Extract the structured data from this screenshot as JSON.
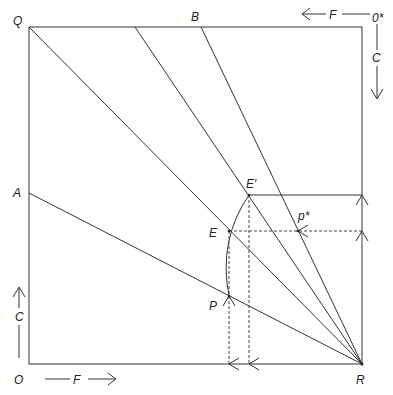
{
  "diagram": {
    "type": "Edgeworth box / contract construction",
    "labels": {
      "Q": "Q",
      "B": "B",
      "A": "A",
      "O": "O",
      "R": "R",
      "O_star": "0*",
      "E_prime": "E′",
      "E": "E",
      "P": "P",
      "p_star": "p*",
      "F_top": "F",
      "C_right": "C",
      "C_left": "C",
      "F_bottom": "F"
    },
    "points": {
      "Q": [
        29,
        27
      ],
      "top_right": [
        362,
        27
      ],
      "O": [
        29,
        364
      ],
      "R": [
        362,
        364
      ],
      "A": [
        29,
        193
      ],
      "B": [
        201,
        27
      ],
      "T2": [
        135,
        27
      ],
      "E_prime": [
        249,
        195
      ],
      "E": [
        229,
        231
      ],
      "P": [
        229,
        296
      ],
      "p_star": [
        298,
        231
      ]
    },
    "colors": {
      "line": "#333333",
      "text": "#222222",
      "background": "#ffffff"
    }
  }
}
